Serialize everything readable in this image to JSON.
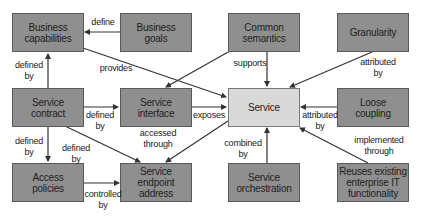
{
  "diagram": {
    "colors": {
      "node_fill": "#8f8f8f",
      "center_fill": "#d9d9d9",
      "edge": "#333333"
    },
    "nodes": {
      "business_capabilities": "Business\ncapabilities",
      "business_goals": "Business\ngoals",
      "common_semantics": "Common\nsemantics",
      "granularity": "Granularity",
      "service_contract": "Service\ncontract",
      "service_interface": "Service\ninterface",
      "service": "Service",
      "loose_coupling": "Loose\ncoupling",
      "access_policies": "Access\npolicies",
      "service_endpoint_address": "Service\nendpoint\naddress",
      "service_orchestration": "Service\norchestration",
      "reuses_existing": "Reuses existing\nenterprise IT\nfunctionality"
    },
    "edges": [
      {
        "from": "business_goals",
        "to": "business_capabilities",
        "label": "define"
      },
      {
        "from": "service_contract",
        "to": "business_capabilities",
        "label": "defined\nby"
      },
      {
        "from": "business_capabilities",
        "to": "service",
        "label": "provides"
      },
      {
        "from": "common_semantics",
        "to": "service_interface",
        "label": ""
      },
      {
        "from": "common_semantics",
        "to": "service",
        "label": "supports"
      },
      {
        "from": "granularity",
        "to": "service",
        "label": "attributed\nby"
      },
      {
        "from": "service_contract",
        "to": "service_interface",
        "label": "defined\nby"
      },
      {
        "from": "service_interface",
        "to": "service",
        "label": "exposes"
      },
      {
        "from": "loose_coupling",
        "to": "service",
        "label": "attributed\nby"
      },
      {
        "from": "service_contract",
        "to": "access_policies",
        "label": "defined\nby"
      },
      {
        "from": "service_contract",
        "to": "service_endpoint_address",
        "label": "defined\nby"
      },
      {
        "from": "service",
        "to": "service_endpoint_address",
        "label": "accessed\nthrough"
      },
      {
        "from": "access_policies",
        "to": "service_endpoint_address",
        "label": "controlled\nby"
      },
      {
        "from": "service_orchestration",
        "to": "service",
        "label": "combined\nby"
      },
      {
        "from": "reuses_existing",
        "to": "service",
        "label": "implemented\nthrough"
      }
    ],
    "labels": {
      "define": "define",
      "defined_by_cap": "defined\nby",
      "provides": "provides",
      "supports": "supports",
      "attributed_by_gran": "attributed\nby",
      "defined_by_iface": "defined\nby",
      "exposes": "exposes",
      "attributed_by_loose": "attributed\nby",
      "accessed_through": "accessed\nthrough",
      "defined_by_access": "defined\nby",
      "defined_by_endpoint": "defined\nby",
      "controlled_by": "controlled\nby",
      "combined_by": "combined\nby",
      "implemented_through": "implemented\nthrough"
    }
  }
}
